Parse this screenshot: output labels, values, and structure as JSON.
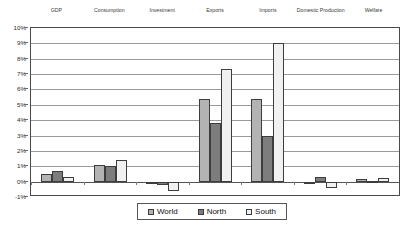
{
  "chart_data": {
    "type": "bar",
    "title": "",
    "xlabel": "",
    "ylabel": "",
    "ylim": [
      -1,
      10
    ],
    "ytick_labels": [
      "10%",
      "9%",
      "8%",
      "7%",
      "6%",
      "5%",
      "4%",
      "3%",
      "2%",
      "1%",
      "0%",
      "-1%"
    ],
    "ytick_values": [
      10,
      9,
      8,
      7,
      6,
      5,
      4,
      3,
      2,
      1,
      0,
      -1
    ],
    "grid": true,
    "category_label_position": "top",
    "legend_position": "bottom-center",
    "categories": [
      "GDP",
      "Consumption",
      "Investment",
      "Exports",
      "Imports",
      "Domestic Production",
      "Welfare"
    ],
    "series": [
      {
        "name": "World",
        "color": "#b3b3b3",
        "values": [
          0.5,
          1.1,
          0.0,
          5.4,
          5.4,
          0.0,
          0.15
        ]
      },
      {
        "name": "North",
        "color": "#7d7d7d",
        "values": [
          0.7,
          1.0,
          -0.2,
          3.8,
          3.0,
          0.3,
          0.05
        ]
      },
      {
        "name": "South",
        "color": "#f1f1f1",
        "values": [
          0.3,
          1.4,
          -0.6,
          7.3,
          9.0,
          -0.4,
          0.25
        ]
      }
    ]
  },
  "legend": {
    "items": [
      {
        "label": "World",
        "color": "#b3b3b3"
      },
      {
        "label": "North",
        "color": "#7d7d7d"
      },
      {
        "label": "South",
        "color": "#f1f1f1"
      }
    ]
  }
}
